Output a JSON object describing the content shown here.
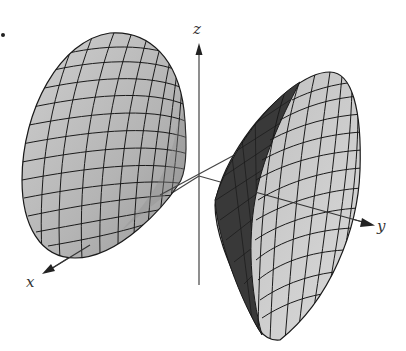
{
  "figure": {
    "title": "",
    "axes": {
      "x": {
        "label": "x"
      },
      "y": {
        "label": "y"
      },
      "z": {
        "label": "z"
      }
    },
    "colors": {
      "surface_light": "#c8c8c8",
      "surface_mid": "#aaaaaa",
      "surface_dark": "#3a3a3a",
      "mesh_line": "#1a1a1a",
      "axis_line": "#444444",
      "background": "#ffffff"
    },
    "marker": {
      "type": "bullet-dot"
    }
  }
}
